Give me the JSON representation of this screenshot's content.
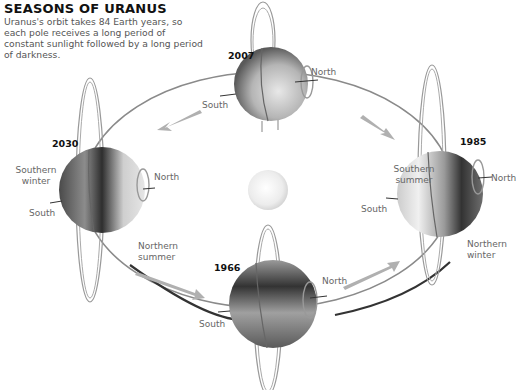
{
  "header": {
    "title": "SEASONS OF URANUS",
    "description": "Uranus's orbit takes 84 Earth years, so each pole receives a long period of constant sunlight followed by a long period of darkness."
  },
  "positions": [
    {
      "year": "2007",
      "labels": {
        "north": "North",
        "south": "South"
      }
    },
    {
      "year": "1985",
      "labels": {
        "north": "North",
        "south": "South",
        "season_south": "Southern summer",
        "season_north": "Northern winter"
      }
    },
    {
      "year": "1966",
      "labels": {
        "north": "North",
        "south": "South"
      }
    },
    {
      "year": "2030",
      "labels": {
        "north": "North",
        "south": "South",
        "season_south": "Southern winter",
        "season_north": "Northern summer"
      }
    }
  ],
  "center": {
    "name": "sun"
  },
  "colors": {
    "planet_dark": "#3a3a3a",
    "planet_light": "#e8e8e8",
    "orbit": "#777777",
    "arrow": "#b5b5b5",
    "label": "#666666"
  }
}
